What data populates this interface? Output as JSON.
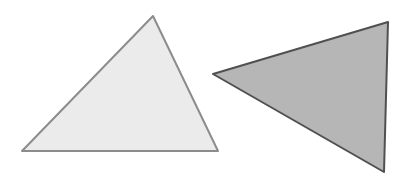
{
  "diagram": {
    "background": "#ffffff",
    "shapes": [
      {
        "name": "light-triangle",
        "type": "triangle",
        "points": "153,16 218,151 22,151",
        "fill": "#ebebeb",
        "stroke": "#8c8c8c",
        "stroke_width": 2
      },
      {
        "name": "dark-triangle",
        "type": "triangle",
        "points": "213,74 388,22 384,172",
        "fill": "#b6b6b6",
        "stroke": "#505050",
        "stroke_width": 2
      }
    ]
  }
}
